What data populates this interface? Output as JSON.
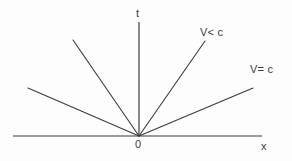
{
  "figure": {
    "type": "minkowski-spacetime-diagram",
    "background_color": "#fdfdfd",
    "line_color": "#3b3b3b",
    "text_color": "#3b3b3b"
  },
  "axes": {
    "vertical": {
      "label": "t",
      "x": 139,
      "y_top": 22,
      "y_bottom": 136
    },
    "horizontal": {
      "label": "x",
      "y": 136,
      "x_left": 13,
      "x_right": 262
    },
    "origin": {
      "label": "0",
      "x": 139,
      "y": 136
    }
  },
  "worldlines": [
    {
      "name": "left-shallow-ray",
      "x1": 139,
      "y1": 136,
      "x2": 28,
      "y2": 88,
      "label": ""
    },
    {
      "name": "left-steep-ray",
      "x1": 139,
      "y1": 136,
      "x2": 73,
      "y2": 40,
      "label": ""
    },
    {
      "name": "right-steep-ray",
      "x1": 139,
      "y1": 136,
      "x2": 205,
      "y2": 41,
      "label": "V< c"
    },
    {
      "name": "right-shallow-ray",
      "x1": 139,
      "y1": 136,
      "x2": 253,
      "y2": 88,
      "label": "V= c"
    }
  ],
  "labels": {
    "t_axis": "t",
    "x_axis": "x",
    "origin": "0",
    "v_less_than_c": "V< c",
    "v_equals_c": "V= c"
  }
}
